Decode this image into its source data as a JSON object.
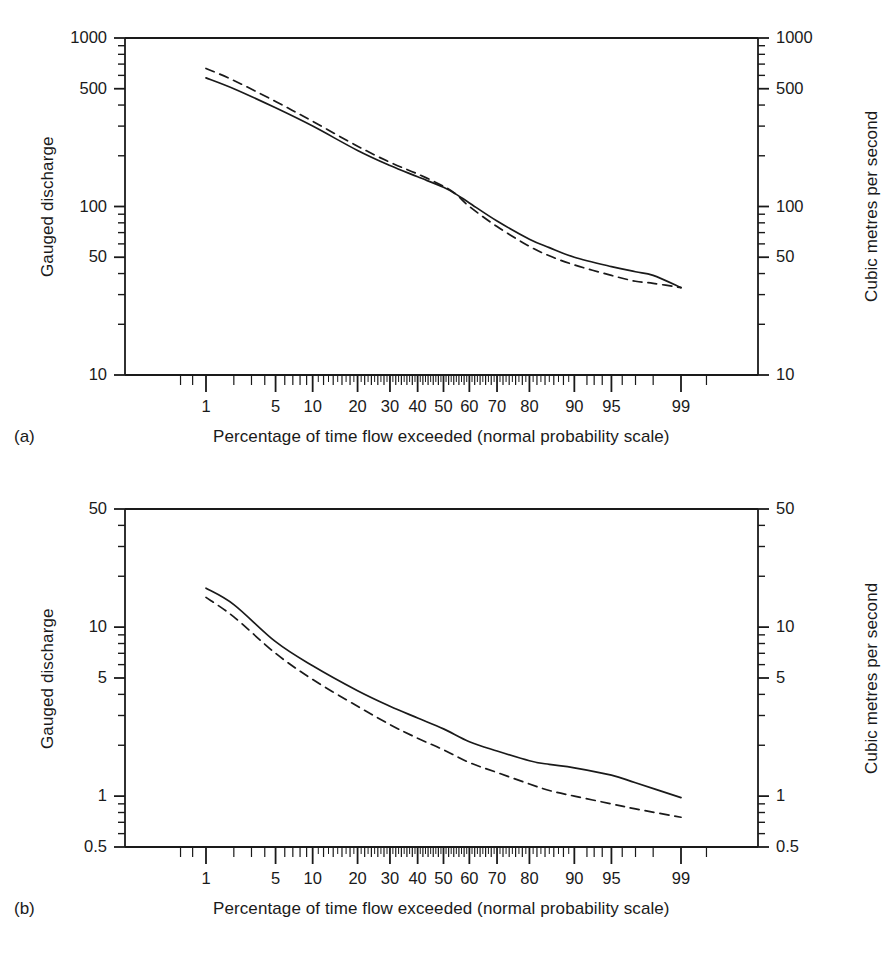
{
  "figure": {
    "background": "#ffffff",
    "ink": "#1a1a1a",
    "panels": [
      {
        "id": "a",
        "letter": "(a)",
        "y_left_title": "Gauged discharge",
        "y_right_title": "Cubic metres per second",
        "x_title": "Percentage of time flow exceeded (normal probability scale)",
        "y_tick_labels": [
          "1000",
          "500",
          "100",
          "50",
          "10"
        ],
        "y_tick_values": [
          1000,
          500,
          100,
          50,
          10
        ],
        "x_tick_labels": [
          "1",
          "5",
          "10",
          "20",
          "30",
          "40",
          "50",
          "60",
          "70",
          "80",
          "90",
          "95",
          "99"
        ],
        "x_tick_values": [
          1,
          5,
          10,
          20,
          30,
          40,
          50,
          60,
          70,
          80,
          90,
          95,
          99
        ]
      },
      {
        "id": "b",
        "letter": "(b)",
        "y_left_title": "Gauged discharge",
        "y_right_title": "Cubic metres per second",
        "x_title": "Percentage of time flow exceeded (normal probability scale)",
        "y_tick_labels": [
          "50",
          "10",
          "5",
          "1",
          "0.5"
        ],
        "y_tick_values": [
          50,
          10,
          5,
          1,
          0.5
        ],
        "x_tick_labels": [
          "1",
          "5",
          "10",
          "20",
          "30",
          "40",
          "50",
          "60",
          "70",
          "80",
          "90",
          "95",
          "99"
        ],
        "x_tick_values": [
          1,
          5,
          10,
          20,
          30,
          40,
          50,
          60,
          70,
          80,
          90,
          95,
          99
        ]
      }
    ]
  },
  "chart_data": [
    {
      "type": "line",
      "id": "a",
      "title": "",
      "xlabel": "Percentage of time flow exceeded (normal probability scale)",
      "ylabel": "Gauged discharge",
      "ylabel_right": "Cubic metres per second",
      "xscale": "normal-probability",
      "yscale": "log",
      "ylim": [
        10,
        1000
      ],
      "xlim": [
        0.2,
        99.8
      ],
      "grid": false,
      "legend": "none",
      "x_ticks_major": [
        1,
        5,
        10,
        20,
        30,
        40,
        50,
        60,
        70,
        80,
        90,
        95,
        99
      ],
      "y_ticks_major": [
        10,
        50,
        100,
        500,
        1000
      ],
      "series": [
        {
          "name": "solid",
          "style": "solid",
          "x": [
            1,
            2,
            5,
            10,
            20,
            30,
            40,
            50,
            55,
            60,
            70,
            80,
            85,
            90,
            95,
            97,
            98,
            99
          ],
          "y": [
            580,
            500,
            385,
            300,
            215,
            175,
            150,
            130,
            118,
            105,
            82,
            64,
            57,
            50,
            44,
            41,
            39,
            33
          ]
        },
        {
          "name": "dashed",
          "style": "dashed",
          "x": [
            1,
            2,
            5,
            10,
            20,
            30,
            40,
            50,
            55,
            60,
            70,
            80,
            85,
            90,
            95,
            97,
            98,
            99
          ],
          "y": [
            660,
            560,
            420,
            320,
            228,
            183,
            156,
            132,
            118,
            100,
            76,
            58,
            51,
            45,
            39,
            36,
            35,
            33
          ]
        }
      ]
    },
    {
      "type": "line",
      "id": "b",
      "title": "",
      "xlabel": "Percentage of time flow exceeded (normal probability scale)",
      "ylabel": "Gauged discharge",
      "ylabel_right": "Cubic metres per second",
      "xscale": "normal-probability",
      "yscale": "log",
      "ylim": [
        0.5,
        50
      ],
      "xlim": [
        0.2,
        99.8
      ],
      "grid": false,
      "legend": "none",
      "x_ticks_major": [
        1,
        5,
        10,
        20,
        30,
        40,
        50,
        60,
        70,
        80,
        90,
        95,
        99
      ],
      "y_ticks_major": [
        0.5,
        1,
        5,
        10,
        50
      ],
      "series": [
        {
          "name": "solid",
          "style": "solid",
          "x": [
            1,
            2,
            5,
            10,
            20,
            30,
            40,
            50,
            60,
            70,
            80,
            85,
            90,
            95,
            97,
            99
          ],
          "y": [
            17.0,
            13.6,
            8.2,
            5.9,
            4.2,
            3.4,
            2.9,
            2.5,
            2.1,
            1.85,
            1.62,
            1.54,
            1.47,
            1.33,
            1.2,
            0.98
          ]
        },
        {
          "name": "dashed",
          "style": "dashed",
          "x": [
            1,
            2,
            5,
            10,
            20,
            30,
            40,
            50,
            60,
            70,
            80,
            85,
            90,
            95,
            97,
            99
          ],
          "y": [
            15.0,
            11.5,
            7.0,
            4.9,
            3.4,
            2.65,
            2.2,
            1.88,
            1.58,
            1.38,
            1.18,
            1.08,
            1.0,
            0.9,
            0.84,
            0.75
          ]
        }
      ]
    }
  ]
}
